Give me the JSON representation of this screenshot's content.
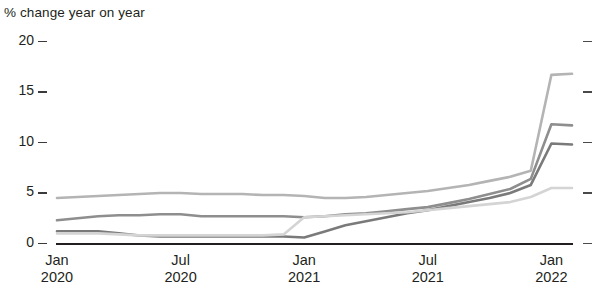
{
  "chart_data": {
    "type": "line",
    "title": "% change year on year",
    "xlabel": "",
    "ylabel": "% change year on year",
    "ylim": [
      0,
      20
    ],
    "yticks": [
      0,
      5,
      10,
      15,
      20
    ],
    "ytick_labels": [
      "0",
      "5",
      "10",
      "15",
      "20"
    ],
    "grid": false,
    "legend": "none",
    "xtick_labels": [
      {
        "month": "Jan",
        "year": "2020"
      },
      {
        "month": "Jul",
        "year": "2020"
      },
      {
        "month": "Jan",
        "year": "2021"
      },
      {
        "month": "Jul",
        "year": "2021"
      },
      {
        "month": "Jan",
        "year": "2022"
      }
    ],
    "x": [
      "Jan 2020",
      "Feb 2020",
      "Mar 2020",
      "Apr 2020",
      "May 2020",
      "Jun 2020",
      "Jul 2020",
      "Aug 2020",
      "Sep 2020",
      "Oct 2020",
      "Nov 2020",
      "Dec 2020",
      "Jan 2021",
      "Feb 2021",
      "Mar 2021",
      "Apr 2021",
      "May 2021",
      "Jun 2021",
      "Jul 2021",
      "Aug 2021",
      "Sep 2021",
      "Oct 2021",
      "Nov 2021",
      "Dec 2021",
      "Jan 2022",
      "Feb 2022"
    ],
    "series": [
      {
        "name": "series-1",
        "color": "#b4b4b4",
        "values": [
          4.5,
          4.6,
          4.7,
          4.8,
          4.9,
          5.0,
          5.0,
          4.9,
          4.9,
          4.9,
          4.8,
          4.8,
          4.7,
          4.5,
          4.5,
          4.6,
          4.8,
          5.0,
          5.2,
          5.5,
          5.8,
          6.2,
          6.6,
          7.2,
          16.7,
          16.8
        ]
      },
      {
        "name": "series-2",
        "color": "#8e8e8e",
        "values": [
          2.3,
          2.5,
          2.7,
          2.8,
          2.8,
          2.9,
          2.9,
          2.7,
          2.7,
          2.7,
          2.7,
          2.7,
          2.6,
          2.7,
          2.9,
          3.0,
          3.2,
          3.4,
          3.6,
          4.0,
          4.4,
          4.9,
          5.4,
          6.4,
          11.8,
          11.7
        ]
      },
      {
        "name": "series-3",
        "color": "#7a7a7a",
        "values": [
          1.2,
          1.2,
          1.2,
          1.0,
          0.8,
          0.7,
          0.7,
          0.7,
          0.7,
          0.7,
          0.7,
          0.7,
          0.6,
          1.2,
          1.8,
          2.2,
          2.6,
          3.0,
          3.3,
          3.7,
          4.1,
          4.5,
          5.0,
          5.8,
          9.9,
          9.8
        ]
      },
      {
        "name": "series-4",
        "color": "#d4d4d4",
        "values": [
          1.0,
          1.0,
          1.0,
          0.9,
          0.8,
          0.8,
          0.8,
          0.8,
          0.8,
          0.8,
          0.8,
          0.9,
          2.6,
          2.7,
          2.8,
          2.9,
          3.0,
          3.1,
          3.3,
          3.5,
          3.7,
          3.9,
          4.1,
          4.6,
          5.5,
          5.5
        ]
      }
    ]
  }
}
